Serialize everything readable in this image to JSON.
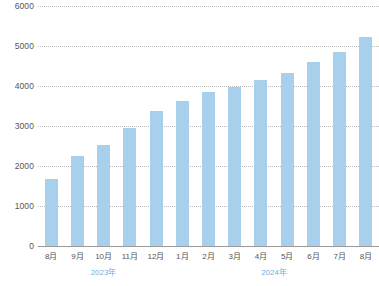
{
  "chart_data": {
    "type": "bar",
    "title": "",
    "xlabel": "",
    "ylabel": "",
    "ylim": [
      0,
      6000
    ],
    "grid": true,
    "legend": "none",
    "categories": [
      "8月",
      "9月",
      "10月",
      "11月",
      "12月",
      "1月",
      "2月",
      "3月",
      "4月",
      "5月",
      "6月",
      "7月",
      "8月"
    ],
    "values": [
      1670,
      2250,
      2520,
      2960,
      3370,
      3620,
      3850,
      3980,
      4150,
      4320,
      4600,
      4840,
      5220
    ],
    "ytick_labels": [
      "6000",
      "5000",
      "4000",
      "3000",
      "2000",
      "1000",
      "0"
    ],
    "ytick_values": [
      6000,
      5000,
      4000,
      3000,
      2000,
      1000,
      0
    ],
    "group_labels": [
      {
        "label": "2023年",
        "span_start": 0,
        "span_end": 4
      },
      {
        "label": "2024年",
        "span_start": 5,
        "span_end": 12
      }
    ],
    "series": [
      {
        "name": "",
        "values": [
          1670,
          2250,
          2520,
          2960,
          3370,
          3620,
          3850,
          3980,
          4150,
          4320,
          4600,
          4840,
          5220
        ]
      }
    ],
    "colors": {
      "bar": "#a8cfec",
      "gridline": "#b9b9b9",
      "axis": "#9a9a9a",
      "tick_text": "#555555",
      "year_text": "#74afd8"
    }
  },
  "clipped_header": {
    "text": ""
  }
}
